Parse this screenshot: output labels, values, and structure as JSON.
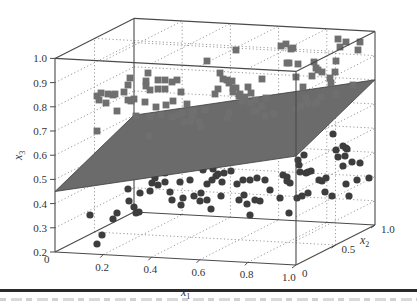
{
  "chart_data": {
    "type": "scatter",
    "projection": "3d",
    "title": "",
    "xlabel": "x1",
    "ylabel": "x2",
    "zlabel": "x3",
    "xlim": [
      0,
      1.0
    ],
    "ylim": [
      0,
      1.0
    ],
    "zlim": [
      0.2,
      1.0
    ],
    "x_ticks": [
      "0",
      "0.2",
      "0.4",
      "0.6",
      "0.8",
      "1.0"
    ],
    "y_ticks": [
      "0",
      "0.5",
      "1.0"
    ],
    "z_ticks": [
      "0.2",
      "0.3",
      "0.4",
      "0.5",
      "0.6",
      "0.7",
      "0.8",
      "0.9",
      "1.0"
    ],
    "grid": true,
    "legend": null,
    "separating_plane": {
      "description": "gray linear decision plane separating the two classes",
      "x3_at_x1_0_x2_0": 0.45,
      "x3_at_x1_0_x2_1": 0.6,
      "x3_at_x1_1_x2_1": 0.8,
      "x3_at_x1_1_x2_0": 0.65,
      "color": "#6b6b6b"
    },
    "series": [
      {
        "name": "class above plane",
        "marker": "square",
        "color": "#6f6f6f",
        "approx_count": 110,
        "x3_range": [
          0.65,
          1.0
        ]
      },
      {
        "name": "class below plane",
        "marker": "circle",
        "color": "#3d3d3d",
        "approx_count": 130,
        "x3_range": [
          0.2,
          0.6
        ]
      }
    ],
    "points_px": {
      "squares": [
        [
          97,
          96
        ],
        [
          99,
          100
        ],
        [
          101,
          93
        ],
        [
          108,
          94
        ],
        [
          113,
          95
        ],
        [
          106,
          103
        ],
        [
          117,
          111
        ],
        [
          115,
          94
        ],
        [
          124,
          92
        ],
        [
          128,
          85
        ],
        [
          130,
          78
        ],
        [
          128,
          100
        ],
        [
          131,
          101
        ],
        [
          134,
          99
        ],
        [
          136,
          116
        ],
        [
          145,
          102
        ],
        [
          146,
          86
        ],
        [
          148,
          73
        ],
        [
          146,
          81
        ],
        [
          150,
          90
        ],
        [
          150,
          117
        ],
        [
          156,
          107
        ],
        [
          158,
          89
        ],
        [
          161,
          115
        ],
        [
          158,
          80
        ],
        [
          165,
          80
        ],
        [
          165,
          89
        ],
        [
          166,
          105
        ],
        [
          172,
          82
        ],
        [
          173,
          101
        ],
        [
          177,
          80
        ],
        [
          178,
          115
        ],
        [
          172,
          117
        ],
        [
          182,
          113
        ],
        [
          184,
          122
        ],
        [
          181,
          92
        ],
        [
          187,
          104
        ],
        [
          191,
          121
        ],
        [
          192,
          113
        ],
        [
          192,
          116
        ],
        [
          194,
          111
        ],
        [
          199,
          122
        ],
        [
          205,
          110
        ],
        [
          201,
          127
        ],
        [
          149,
          136
        ],
        [
          97,
          131
        ],
        [
          215,
          94
        ],
        [
          227,
          118
        ],
        [
          229,
          113
        ],
        [
          220,
          73
        ],
        [
          223,
          79
        ],
        [
          227,
          80
        ],
        [
          229,
          83
        ],
        [
          232,
          81
        ],
        [
          233,
          88
        ],
        [
          233,
          92
        ],
        [
          236,
          88
        ],
        [
          239,
          96
        ],
        [
          242,
          101
        ],
        [
          245,
          97
        ],
        [
          240,
          94
        ],
        [
          248,
          87
        ],
        [
          251,
          93
        ],
        [
          254,
          111
        ],
        [
          257,
          111
        ],
        [
          250,
          103
        ],
        [
          255,
          100
        ],
        [
          262,
          106
        ],
        [
          266,
          98
        ],
        [
          274,
          114
        ],
        [
          262,
          79
        ],
        [
          265,
          116
        ],
        [
          281,
          46
        ],
        [
          286,
          44
        ],
        [
          291,
          49
        ],
        [
          293,
          48
        ],
        [
          287,
          63
        ],
        [
          289,
          63
        ],
        [
          298,
          64
        ],
        [
          236,
          50
        ],
        [
          207,
          61
        ],
        [
          218,
          89
        ],
        [
          314,
          62
        ],
        [
          316,
          68
        ],
        [
          318,
          70
        ],
        [
          312,
          76
        ],
        [
          322,
          72
        ],
        [
          330,
          78
        ],
        [
          335,
          72
        ],
        [
          296,
          77
        ],
        [
          303,
          87
        ],
        [
          306,
          98
        ],
        [
          315,
          104
        ],
        [
          317,
          102
        ],
        [
          321,
          97
        ],
        [
          338,
          39
        ],
        [
          340,
          47
        ],
        [
          346,
          42
        ],
        [
          360,
          42
        ],
        [
          358,
          50
        ],
        [
          336,
          61
        ],
        [
          331,
          83
        ],
        [
          353,
          85
        ],
        [
          336,
          94
        ],
        [
          296,
          109
        ],
        [
          301,
          106
        ],
        [
          308,
          103
        ]
      ],
      "circles": [
        [
          90,
          215
        ],
        [
          97,
          244
        ],
        [
          102,
          235
        ],
        [
          113,
          219
        ],
        [
          117,
          213
        ],
        [
          129,
          201
        ],
        [
          128,
          189
        ],
        [
          134,
          207
        ],
        [
          139,
          212
        ],
        [
          136,
          213
        ],
        [
          140,
          193
        ],
        [
          150,
          191
        ],
        [
          152,
          183
        ],
        [
          155,
          178
        ],
        [
          165,
          173
        ],
        [
          158,
          185
        ],
        [
          165,
          182
        ],
        [
          170,
          192
        ],
        [
          172,
          200
        ],
        [
          181,
          205
        ],
        [
          183,
          198
        ],
        [
          180,
          182
        ],
        [
          190,
          180
        ],
        [
          194,
          196
        ],
        [
          200,
          201
        ],
        [
          201,
          193
        ],
        [
          207,
          200
        ],
        [
          207,
          184
        ],
        [
          212,
          180
        ],
        [
          222,
          182
        ],
        [
          203,
          170
        ],
        [
          213,
          169
        ],
        [
          216,
          176
        ],
        [
          218,
          174
        ],
        [
          224,
          173
        ],
        [
          231,
          171
        ],
        [
          211,
          209
        ],
        [
          221,
          196
        ],
        [
          239,
          200
        ],
        [
          237,
          184
        ],
        [
          243,
          180
        ],
        [
          250,
          180
        ],
        [
          244,
          195
        ],
        [
          257,
          178
        ],
        [
          265,
          180
        ],
        [
          270,
          190
        ],
        [
          260,
          201
        ],
        [
          280,
          198
        ],
        [
          247,
          204
        ],
        [
          250,
          215
        ],
        [
          255,
          200
        ],
        [
          283,
          175
        ],
        [
          287,
          177
        ],
        [
          287,
          181
        ],
        [
          300,
          172
        ],
        [
          308,
          172
        ],
        [
          311,
          171
        ],
        [
          298,
          160
        ],
        [
          304,
          155
        ],
        [
          299,
          165
        ],
        [
          306,
          173
        ],
        [
          290,
          183
        ],
        [
          297,
          198
        ],
        [
          308,
          193
        ],
        [
          302,
          196
        ],
        [
          289,
          213
        ],
        [
          322,
          181
        ],
        [
          326,
          178
        ],
        [
          319,
          180
        ],
        [
          325,
          192
        ],
        [
          332,
          196
        ],
        [
          346,
          184
        ],
        [
          349,
          196
        ],
        [
          357,
          180
        ],
        [
          352,
          162
        ],
        [
          345,
          156
        ],
        [
          343,
          146
        ],
        [
          346,
          148
        ],
        [
          338,
          157
        ],
        [
          333,
          134
        ],
        [
          343,
          166
        ],
        [
          360,
          163
        ],
        [
          369,
          178
        ],
        [
          336,
          150
        ],
        [
          347,
          149
        ]
      ]
    }
  },
  "axes": {
    "z_tick_labels": [
      "1.0",
      "0.9",
      "0.8",
      "0.7",
      "0.6",
      "0.5",
      "0.4",
      "0.3",
      "0.2"
    ],
    "x_tick_labels": [
      "0",
      "0.2",
      "0.4",
      "0.6",
      "0.8",
      "1.0"
    ],
    "y_tick_labels": [
      "0",
      "0.5",
      "1.0"
    ],
    "x_title": "x",
    "x_sub": "1",
    "y_title": "x",
    "y_sub": "2",
    "z_title": "x",
    "z_sub": "3"
  },
  "colors": {
    "box_edge": "#4a4a4a",
    "grid": "#9a9a9a",
    "plane": "#6b6b6b",
    "plane_edge": "#3a3a3a",
    "square": "#6f6f6f",
    "circle": "#3d3d3d"
  }
}
